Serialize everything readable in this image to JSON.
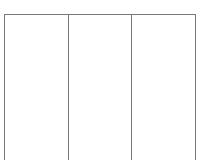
{
  "layout": {
    "line_color": "#7a7a7a",
    "background": "#ffffff"
  },
  "columns": [
    {
      "label": ""
    },
    {
      "label": ""
    },
    {
      "label": ""
    }
  ]
}
